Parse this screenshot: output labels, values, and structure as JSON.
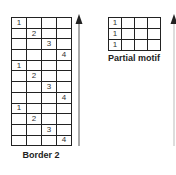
{
  "left_panel": {
    "label": "Border 2",
    "columns": 4,
    "rows": [
      [
        "1",
        "",
        "",
        ""
      ],
      [
        "",
        "2",
        "",
        ""
      ],
      [
        "",
        "",
        "3",
        ""
      ],
      [
        "",
        "",
        "",
        "4"
      ],
      [
        "1",
        "",
        "",
        ""
      ],
      [
        "",
        "2",
        "",
        ""
      ],
      [
        "",
        "",
        "3",
        ""
      ],
      [
        "",
        "",
        "",
        "4"
      ],
      [
        "1",
        "",
        "",
        ""
      ],
      [
        "",
        "2",
        "",
        ""
      ],
      [
        "",
        "",
        "3",
        ""
      ],
      [
        "",
        "",
        "",
        "4"
      ]
    ],
    "arrow_direction": "up"
  },
  "right_panel": {
    "label": "Partial motif",
    "columns": 4,
    "rows": [
      [
        "1",
        "",
        "",
        ""
      ],
      [
        "1",
        "",
        "",
        ""
      ],
      [
        "1",
        "",
        "",
        ""
      ]
    ],
    "arrow_direction": "up"
  },
  "colors": {
    "grid_line": "#222222",
    "text": "#333333",
    "arrow": "#444444"
  }
}
